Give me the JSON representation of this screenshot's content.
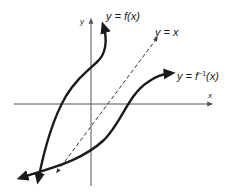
{
  "diagram": {
    "type": "function-inverse-graph",
    "axes": {
      "x_label": "x",
      "y_label": "y"
    },
    "curves": [
      {
        "id": "f",
        "label": "y = f(x)",
        "style": "solid-thick"
      },
      {
        "id": "identity",
        "label": "y = x",
        "style": "dashed"
      },
      {
        "id": "f_inverse",
        "label_prefix": "y = f",
        "label_sup": "−1",
        "label_suffix": "(x)",
        "style": "solid-thick"
      }
    ],
    "colors": {
      "curve": "#1a1a1a",
      "axis": "#555555",
      "background": "#ffffff"
    }
  }
}
